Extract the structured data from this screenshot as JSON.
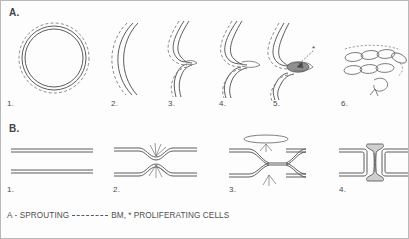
{
  "figure": {
    "sections": [
      {
        "letter": "A.",
        "name": "sprouting-angiogenesis",
        "panels": [
          {
            "number": "1.",
            "description": "vessel cross-section with intact basement membrane"
          },
          {
            "number": "2.",
            "description": "curved vessel segment with basement membrane"
          },
          {
            "number": "3.",
            "description": "small endothelial bud forming at vessel wall"
          },
          {
            "number": "4.",
            "description": "enlarged sprout extending from vessel wall"
          },
          {
            "number": "5.",
            "description": "sprout with proliferating cells at its base"
          },
          {
            "number": "6.",
            "description": "chain of elongated endothelial cells forming new capillary"
          }
        ]
      },
      {
        "letter": "B.",
        "name": "intussusceptive-angiogenesis",
        "panels": [
          {
            "number": "1.",
            "description": "straight vessel with two parallel walls"
          },
          {
            "number": "2.",
            "description": "opposing walls bulge inward toward lumen"
          },
          {
            "number": "3.",
            "description": "walls meet and cross forming contact zone"
          },
          {
            "number": "4.",
            "description": "completed transluminal tissue pillar"
          }
        ]
      }
    ],
    "legend": {
      "sprouting_label": "A - SPROUTING",
      "bm_label": "BM,",
      "proliferating_label": "* PROLIFERATING CELLS",
      "bm_key_style": "dashed-line"
    },
    "markers": {
      "asterisk": "*"
    },
    "colors": {
      "stroke": "#5c5c5c",
      "basement_membrane": "#6f6f6f",
      "text": "#4a4a4a",
      "background": "#ffffff",
      "border": "#b9b9b9"
    }
  }
}
